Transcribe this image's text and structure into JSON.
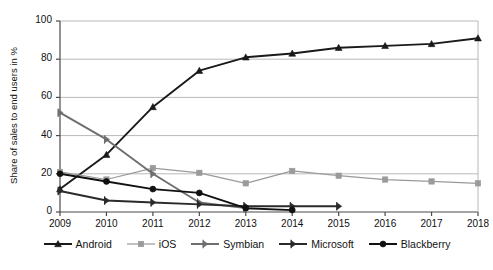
{
  "chart_data": {
    "type": "line",
    "title": "",
    "xlabel": "",
    "ylabel": "Share of sales to end users in %",
    "categories": [
      "2009",
      "2010",
      "2011",
      "2012",
      "2013",
      "2014",
      "2015",
      "2016",
      "2017",
      "2018"
    ],
    "x": [
      2009,
      2010,
      2011,
      2012,
      2013,
      2014,
      2015,
      2016,
      2017,
      2018
    ],
    "xlim": [
      2009,
      2018
    ],
    "ylim": [
      0,
      100
    ],
    "yticks": [
      0,
      20,
      40,
      60,
      80,
      100
    ],
    "grid": true,
    "legend_position": "bottom",
    "series": [
      {
        "name": "Android",
        "marker": "triangle",
        "color": "#1a1a1a",
        "values": [
          12,
          30,
          55,
          74,
          81,
          83,
          86,
          87,
          88,
          91
        ]
      },
      {
        "name": "iOS",
        "marker": "square",
        "color": "#9a9a9a",
        "values": [
          21,
          17,
          23,
          20.5,
          15,
          21.5,
          19,
          17,
          16,
          15
        ]
      },
      {
        "name": "Symbian",
        "marker": "arrow-right",
        "color": "#6e6e6e",
        "values": [
          52,
          38,
          20,
          5,
          2,
          null,
          null,
          null,
          null,
          null
        ]
      },
      {
        "name": "Microsoft",
        "marker": "flag-right",
        "color": "#2a2a2a",
        "values": [
          11,
          6,
          5,
          4,
          3,
          3,
          3,
          null,
          null,
          null
        ]
      },
      {
        "name": "Blackberry",
        "marker": "circle",
        "color": "#111111",
        "values": [
          20,
          16,
          12,
          10,
          2,
          1,
          null,
          null,
          null,
          null
        ]
      }
    ]
  },
  "axis": {
    "y_tick_labels": [
      "0",
      "20",
      "40",
      "60",
      "80",
      "100"
    ],
    "x_tick_labels": [
      "2009",
      "2010",
      "2011",
      "2012",
      "2013",
      "2014",
      "2015",
      "2016",
      "2017",
      "2018"
    ],
    "y_axis_title": "Share of sales to end users in %"
  },
  "legend": {
    "items": [
      {
        "label": "Android"
      },
      {
        "label": "iOS"
      },
      {
        "label": "Symbian"
      },
      {
        "label": "Microsoft"
      },
      {
        "label": "Blackberry"
      }
    ]
  }
}
